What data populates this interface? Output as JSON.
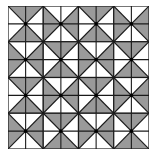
{
  "figure": {
    "title": "",
    "rows": 4,
    "cols": 4,
    "colors": {
      "shade": "#9a9a9a",
      "background": "#ffffff",
      "line": "#1a1a1a",
      "center_dot": "#000000"
    },
    "blocks": [
      [
        "vertical",
        "horizontal",
        "vertical",
        "horizontal"
      ],
      [
        "horizontal",
        "vertical",
        "horizontal",
        "vertical"
      ],
      [
        "vertical",
        "horizontal",
        "vertical",
        "horizontal"
      ],
      [
        "horizontal",
        "vertical",
        "horizontal",
        "vertical"
      ]
    ]
  }
}
